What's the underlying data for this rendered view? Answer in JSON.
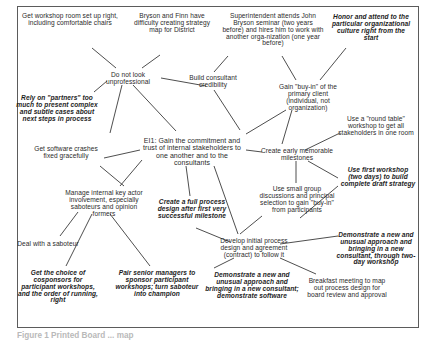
{
  "figure": {
    "caption": "Figure 1   Printed Board ... map"
  },
  "diagram": {
    "type": "node-link-idea-map",
    "nodes": [
      {
        "id": "workshop-room",
        "label": "Get workshop room set up right, including comfortable chairs",
        "style": "plain",
        "x": 22,
        "y": 13,
        "w": 96
      },
      {
        "id": "bryson-finn",
        "label": "Bryson and Finn have difficulty creating strategy map for District",
        "style": "plain",
        "x": 128,
        "y": 13,
        "w": 88
      },
      {
        "id": "superintendent",
        "label": "Superintendent attends John Bryson seminar (two years before) and hires him to work with another orga-nization (one year before)",
        "style": "plain",
        "x": 222,
        "y": 13,
        "w": 102
      },
      {
        "id": "honor-culture",
        "label": "Honor and attend to the particular organizational culture right from the start",
        "style": "emph",
        "x": 330,
        "y": 14,
        "w": 82
      },
      {
        "id": "do-not-look",
        "label": "Do not look unprofessional",
        "style": "plain",
        "x": 96,
        "y": 72,
        "w": 64
      },
      {
        "id": "build-credibility",
        "label": "Build consultant credibility",
        "style": "plain",
        "x": 183,
        "y": 75,
        "w": 60
      },
      {
        "id": "gain-buyin-client",
        "label": "Gain \"buy-in\" of the primary client (individual, not organization)",
        "style": "plain",
        "x": 272,
        "y": 84,
        "w": 72
      },
      {
        "id": "rely-partners",
        "label": "Rely on \"partners\" too much to present complex and subtle cases about next steps in process",
        "style": "emph",
        "x": 12,
        "y": 95,
        "w": 90
      },
      {
        "id": "round-table",
        "label": "Use a \"round table\" workshop to get all stakeholders in one room",
        "style": "plain",
        "x": 338,
        "y": 116,
        "w": 76
      },
      {
        "id": "el1-center",
        "label": "EI1: Gain the commitment and trust of internal stakeholders to one another and to the consultants",
        "style": "center",
        "x": 140,
        "y": 137,
        "w": 104
      },
      {
        "id": "software-crashes",
        "label": "Get software crashes fixed gracefully",
        "style": "plain",
        "x": 28,
        "y": 146,
        "w": 76
      },
      {
        "id": "create-milestones",
        "label": "Create early memorable milestones",
        "style": "plain",
        "x": 259,
        "y": 148,
        "w": 76
      },
      {
        "id": "manage-internal",
        "label": "Manage internal key actor involvement, especially saboteurs and opinion formers",
        "style": "plain",
        "x": 62,
        "y": 190,
        "w": 84
      },
      {
        "id": "use-first-workshop",
        "label": "Use first workshop (two days) to build complete draft strategy",
        "style": "emph",
        "x": 340,
        "y": 167,
        "w": 76
      },
      {
        "id": "small-group",
        "label": "Use small group discussions and principal selection to gain \"buy-in\" from participants",
        "style": "plain",
        "x": 258,
        "y": 186,
        "w": 78
      },
      {
        "id": "full-process",
        "label": "Create a full process design after first very successful milestone",
        "style": "emph",
        "x": 150,
        "y": 199,
        "w": 84
      },
      {
        "id": "deal-saboteur",
        "label": "Deal with a saboteur",
        "style": "plain",
        "x": 10,
        "y": 241,
        "w": 76
      },
      {
        "id": "develop-initial",
        "label": "Develop initial process design and agreement (contract) to follow it",
        "style": "plain",
        "x": 213,
        "y": 238,
        "w": 82
      },
      {
        "id": "demonstrate-two-day",
        "label": "Demonstrate a new and unusual approach and bringing in a new consultant, through two-day workshop",
        "style": "emph",
        "x": 336,
        "y": 232,
        "w": 80
      },
      {
        "id": "cosponsors",
        "label": "Get the choice of cosponsors for participant workshops, and the order of running, right",
        "style": "emph",
        "x": 16,
        "y": 270,
        "w": 84
      },
      {
        "id": "pair-senior",
        "label": "Pair senior managers to sponsor participant workshops; turn saboteur into champion",
        "style": "emph",
        "x": 113,
        "y": 270,
        "w": 88
      },
      {
        "id": "demonstrate-software",
        "label": "Demonstrate a new and unusual approach and bringing in a new consultant; demonstrate software",
        "style": "emph",
        "x": 205,
        "y": 272,
        "w": 94
      },
      {
        "id": "breakfast-meeting",
        "label": "Breakfast meeting to map out process design for board review and approval",
        "style": "plain",
        "x": 306,
        "y": 278,
        "w": 82
      }
    ],
    "edges": [
      {
        "from": "workshop-room",
        "to": "do-not-look",
        "path": "M 92,48 L 116,68"
      },
      {
        "from": "bryson-finn",
        "to": "do-not-look",
        "path": "M 160,55 L 142,68"
      },
      {
        "from": "rely-partners",
        "to": "do-not-look",
        "path": "M 94,92 L 107,81"
      },
      {
        "from": "do-not-look",
        "to": "build-credibility",
        "path": "M 161,78 L 206,86"
      },
      {
        "from": "superintendent",
        "to": "build-credibility",
        "path": "M 228,56 L 214,72"
      },
      {
        "from": "superintendent",
        "to": "gain-buyin-client",
        "path": "M 282,56 L 296,80"
      },
      {
        "from": "honor-culture",
        "to": "gain-buyin-client",
        "path": "M 346,48 L 320,80"
      },
      {
        "from": "do-not-look",
        "to": "el1-center",
        "path": "M 122,85 L 110,133"
      },
      {
        "from": "do-not-look",
        "to": "el1-center",
        "path": "M 133,85 L 176,131"
      },
      {
        "from": "build-credibility",
        "to": "el1-center",
        "path": "M 214,90 L 240,130"
      },
      {
        "from": "gain-buyin-client",
        "to": "el1-center",
        "path": "M 286,110 L 246,134"
      },
      {
        "from": "gain-buyin-client",
        "to": "create-milestones",
        "path": "M 292,110 L 282,144"
      },
      {
        "from": "round-table",
        "to": "create-milestones",
        "path": "M 340,133 L 305,150"
      },
      {
        "from": "el1-center",
        "to": "create-milestones",
        "path": "M 246,150 L 262,152"
      },
      {
        "from": "create-milestones",
        "to": "small-group",
        "path": "M 296,161 L 296,183"
      },
      {
        "from": "create-milestones",
        "to": "use-first-workshop",
        "path": "M 308,161 L 338,178"
      },
      {
        "from": "el1-center",
        "to": "software-crashes",
        "path": "M 140,150 L 104,158"
      },
      {
        "from": "software-crashes",
        "to": "manage-internal",
        "path": "M 100,166 L 124,186"
      },
      {
        "from": "el1-center",
        "to": "manage-internal",
        "path": "M 142,160 L 120,186"
      },
      {
        "from": "el1-center",
        "to": "full-process",
        "path": "M 186,166 L 190,196"
      },
      {
        "from": "manage-internal",
        "to": "deal-saboteur",
        "path": "M 78,212 L 60,236"
      },
      {
        "from": "manage-internal",
        "to": "cosponsors",
        "path": "M 92,214 L 66,266"
      },
      {
        "from": "manage-internal",
        "to": "pair-senior",
        "path": "M 110,214 L 150,266"
      },
      {
        "from": "el1-center",
        "to": "develop-initial",
        "path": "M 214,166 L 238,234"
      },
      {
        "from": "full-process",
        "to": "develop-initial",
        "path": "M 196,228 L 230,242"
      },
      {
        "from": "small-group",
        "to": "develop-initial",
        "path": "M 262,216 L 240,234"
      },
      {
        "from": "develop-initial",
        "to": "demonstrate-software",
        "path": "M 234,258 L 214,268"
      },
      {
        "from": "develop-initial",
        "to": "breakfast-meeting",
        "path": "M 280,258 L 316,274"
      },
      {
        "from": "develop-initial",
        "to": "demonstrate-two-day",
        "path": "M 280,244 L 338,236"
      },
      {
        "from": "use-first-workshop",
        "to": "develop-initial",
        "path": "M 338,186 L 300,218"
      }
    ]
  }
}
